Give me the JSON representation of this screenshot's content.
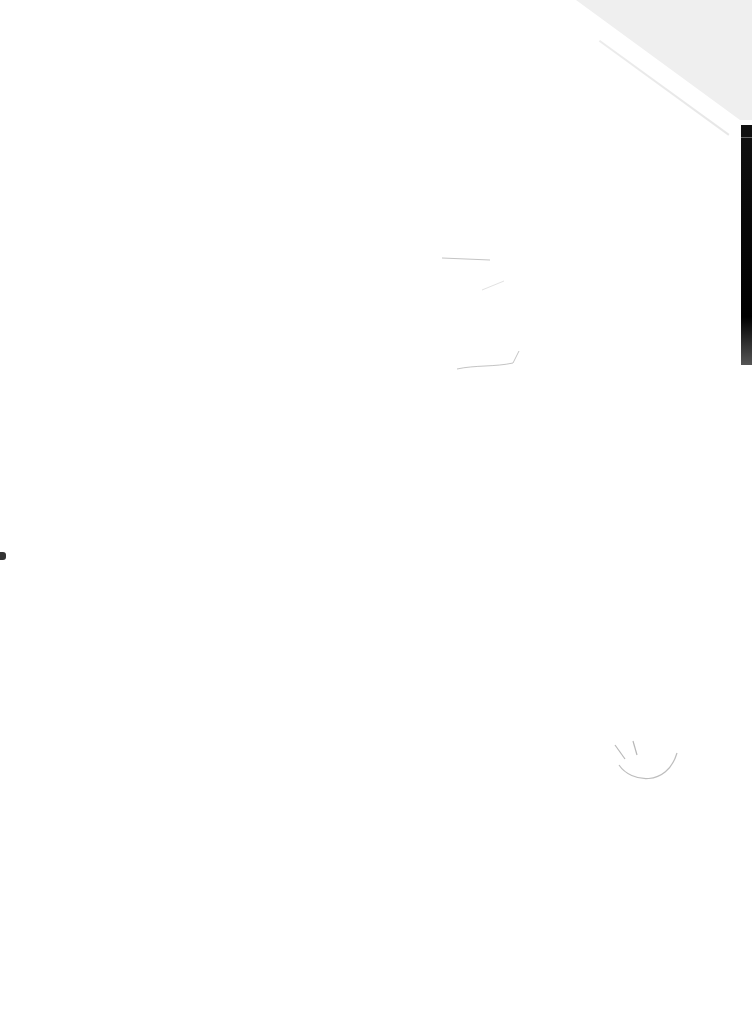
{
  "document": {
    "type": "scanned-page",
    "content": "blank",
    "colors": {
      "paper": "#ffffff",
      "fold_background": "#efefef",
      "edge_strip": "#000000",
      "pencil": "#bdbdbd"
    },
    "marks": [
      {
        "kind": "pencil-line",
        "position": "upper-middle"
      },
      {
        "kind": "pencil-line",
        "position": "upper-middle-lower"
      },
      {
        "kind": "pencil-smiley",
        "position": "lower-right"
      }
    ]
  }
}
